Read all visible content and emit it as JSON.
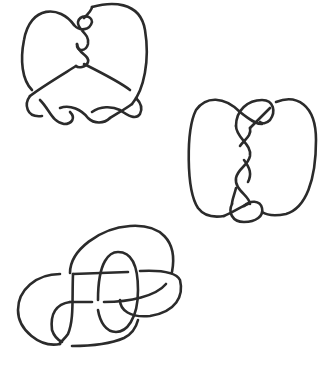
{
  "figure": {
    "stroke_color": "#2b2b2b",
    "background_color": "#ffffff",
    "knots": [
      {
        "id": "knot-top-left",
        "label": "",
        "position": "top-left",
        "features": "heart-shaped loop with vertical 3-crossing twist at top and horizontal twisted band at bottom"
      },
      {
        "id": "knot-middle-right",
        "label": "",
        "position": "middle-right",
        "features": "two side lobes joined by vertical twisted braid with clasp at top and bottom"
      },
      {
        "id": "knot-bottom-left",
        "label": "",
        "position": "bottom-left",
        "features": "overlapping loops with central oval and horizontal crossing strands"
      }
    ],
    "caption": ""
  }
}
